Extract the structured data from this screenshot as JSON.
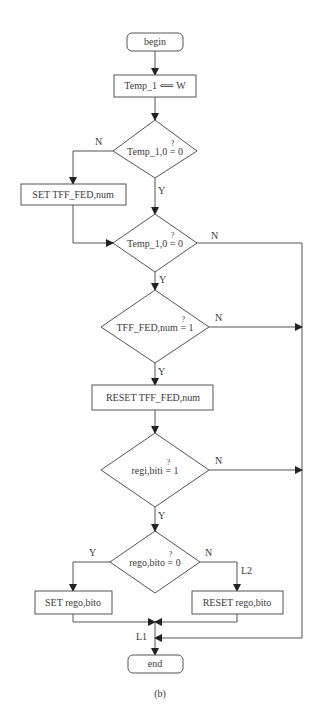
{
  "figure": {
    "caption": "(b)",
    "nodes": {
      "begin": "begin",
      "assign": "Temp_1 ⟸ W",
      "assign_lhs": "Temp_1",
      "assign_rhs": "W",
      "decision1": {
        "lhs": "Temp_1,0",
        "op": "=",
        "rhs": "0",
        "qmark": "?"
      },
      "set_tff": "SET TFF_FED,num",
      "decision2": {
        "lhs": "Temp_1,0",
        "op": "=",
        "rhs": "0",
        "qmark": "?"
      },
      "decision3": {
        "lhs": "TFF_FED,num",
        "op": "=",
        "rhs": "1",
        "qmark": "?"
      },
      "reset_tff": "RESET TFF_FED,num",
      "decision4": {
        "lhs": "regi,biti",
        "op": "=",
        "rhs": "1",
        "qmark": "?"
      },
      "decision5": {
        "lhs": "rego,bito",
        "op": "=",
        "rhs": "0",
        "qmark": "?"
      },
      "set_rego": "SET rego,bito",
      "reset_rego": "RESET rego,bito",
      "end": "end"
    },
    "edge_labels": {
      "d1_no": "N",
      "d1_yes": "Y",
      "d2_no": "N",
      "d2_yes": "Y",
      "d3_no": "N",
      "d3_yes": "Y",
      "d4_no": "N",
      "d4_yes": "Y",
      "d5_yes": "Y",
      "d5_no": "N",
      "l2": "L2",
      "l1": "L1"
    }
  }
}
